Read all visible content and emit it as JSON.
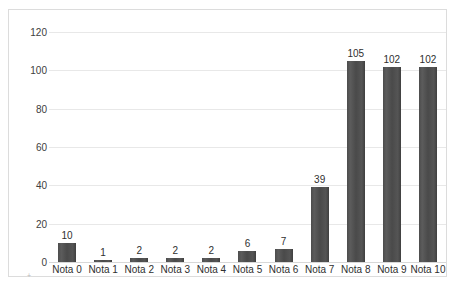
{
  "chart_data": {
    "type": "bar",
    "title": "",
    "subtitle": "",
    "xlabel": "",
    "ylabel": "",
    "categories": [
      "Nota 0",
      "Nota 1",
      "Nota 2",
      "Nota 3",
      "Nota 4",
      "Nota 5",
      "Nota 6",
      "Nota 7",
      "Nota 8",
      "Nota 9",
      "Nota 10"
    ],
    "values": [
      10,
      1,
      2,
      2,
      2,
      6,
      7,
      39,
      105,
      102,
      102
    ],
    "data_labels": [
      "10",
      "1",
      "2",
      "2",
      "2",
      "6",
      "7",
      "39",
      "105",
      "102",
      "102"
    ],
    "ylim": [
      0,
      120
    ],
    "yticks": [
      0,
      20,
      40,
      60,
      80,
      100,
      120
    ],
    "ytick_labels": [
      "0",
      "20",
      "40",
      "60",
      "80",
      "100",
      "120"
    ],
    "grid": true,
    "grid_axis": "y",
    "legend": false,
    "legend_position": "none",
    "bar_color": "#4c4c4c",
    "gridline_color": "#e8e8e8",
    "border_color": "#dcdcdc",
    "background_color": "#ffffff",
    "text_color": "#2f2f2f"
  },
  "artifact": {
    "mark": "+"
  }
}
